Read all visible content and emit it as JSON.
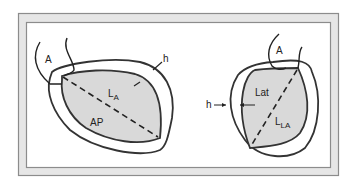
{
  "figure": {
    "colors": {
      "frame_outer": "#8c8c8c",
      "frame_fill": "#e6e6e6",
      "wall_stroke": "#333333",
      "cavity_fill": "#d9d9d9",
      "background": "#ffffff"
    },
    "left_view": {
      "view_label": "AP",
      "aorta_label": "A",
      "length_label_main": "L",
      "length_label_sub": "A",
      "wall_thickness_label": "h"
    },
    "right_view": {
      "view_label": "Lat",
      "aorta_label": "A",
      "length_label_main": "L",
      "length_label_sub": "LA",
      "wall_thickness_label": "h"
    }
  }
}
